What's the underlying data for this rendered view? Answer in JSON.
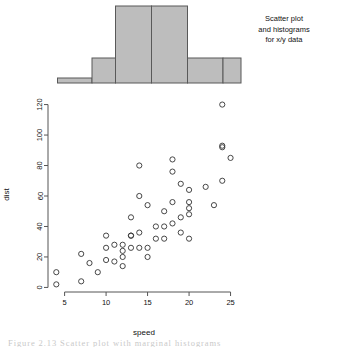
{
  "figure": {
    "annotation_lines": [
      "Scatter plot",
      "and histograms",
      "for x/y data"
    ],
    "caption": "Figure 2.13  Scatter plot with marginal histograms",
    "background": "#ffffff",
    "bar_fill": "#bdbdbd",
    "bar_stroke": "#595959",
    "axis_color": "#555555",
    "point_color": "#333333"
  },
  "chart_data": {
    "type": "scatter",
    "title": "",
    "xlabel": "speed",
    "ylabel": "dist",
    "xlim": [
      3.0,
      26.5
    ],
    "ylim": [
      -3,
      123
    ],
    "xticks": [
      5,
      10,
      15,
      20,
      25
    ],
    "yticks": [
      0,
      20,
      40,
      60,
      80,
      100,
      120
    ],
    "grid": false,
    "legend": "none",
    "n_points": 50,
    "x": [
      4,
      4,
      7,
      7,
      8,
      9,
      10,
      10,
      10,
      11,
      11,
      12,
      12,
      12,
      12,
      13,
      13,
      13,
      13,
      14,
      14,
      14,
      14,
      15,
      15,
      15,
      16,
      16,
      17,
      17,
      17,
      18,
      18,
      18,
      18,
      19,
      19,
      19,
      20,
      20,
      20,
      20,
      20,
      22,
      23,
      24,
      24,
      24,
      24,
      25
    ],
    "y": [
      2,
      10,
      4,
      22,
      16,
      10,
      18,
      26,
      34,
      17,
      28,
      14,
      20,
      24,
      28,
      26,
      34,
      34,
      46,
      26,
      36,
      60,
      80,
      20,
      26,
      54,
      32,
      40,
      32,
      40,
      50,
      42,
      56,
      76,
      84,
      36,
      46,
      68,
      32,
      48,
      52,
      56,
      64,
      66,
      54,
      70,
      92,
      93,
      120,
      85
    ],
    "marker": "open-circle",
    "marker_size": 3.4,
    "marginal_histograms": {
      "top": {
        "orientation": "vertical",
        "variable": "speed",
        "breaks": [
          4,
          9,
          12,
          16,
          20,
          24,
          26
        ],
        "bin_edges_px": [
          57.5,
          92.0,
          115.5,
          151.5,
          187.5,
          223.0,
          241.0
        ],
        "counts": [
          1,
          3,
          8,
          8,
          3,
          3
        ],
        "bar_heights_px": [
          5,
          25,
          77,
          77,
          25,
          25
        ],
        "baseline_y_px": 83,
        "top_y_px": 2
      },
      "right": {
        "orientation": "horizontal",
        "variable": "dist",
        "breaks": [
          0,
          20,
          40,
          60,
          80,
          100,
          120
        ],
        "counts": [
          1,
          2,
          3,
          4,
          8,
          5
        ],
        "bar_widths_px": [
          4,
          14,
          22,
          33,
          61,
          32
        ],
        "bar_bottom_px": [
          105,
          137,
          167,
          199,
          230,
          262
        ],
        "bar_top_px": [
          137,
          167,
          199,
          230,
          262,
          293
        ],
        "baseline_x_px": 249
      }
    }
  },
  "axis": {
    "x_tick_labels": [
      "5",
      "10",
      "15",
      "20",
      "25"
    ],
    "y_tick_labels": [
      "0",
      "20",
      "40",
      "60",
      "80",
      "100",
      "120"
    ]
  }
}
